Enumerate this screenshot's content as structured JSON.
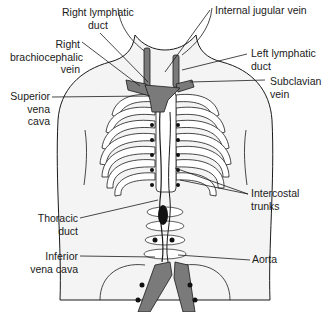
{
  "diagram": {
    "labels": {
      "right_lymphatic_duct": "Right lymphatic\nduct",
      "right_brachiocephalic_vein": "Right\nbrachiocephalic\nvein",
      "superior_vena_cava": "Superior\nvena\ncava",
      "thoracic_duct": "Thoracic\nduct",
      "inferior_vena_cava": "Inferior\nvena cava",
      "internal_jugular_vein": "Internal jugular vein",
      "left_lymphatic_duct": "Left lymphatic\nduct",
      "subclavian_vein": "Subclavian\nvein",
      "intercostal_trunks": "Intercostal\ntrunks",
      "aorta": "Aorta"
    },
    "colors": {
      "vessel_fill": "#7a7a7a",
      "outline": "#1a1a1a",
      "node_fill": "#111111",
      "body_fill": "#f4f4f4",
      "rib_fill": "#ffffff"
    }
  }
}
